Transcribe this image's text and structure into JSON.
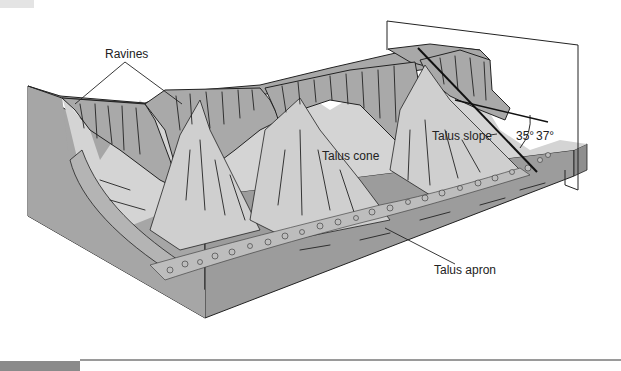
{
  "figure": {
    "type": "geologic block diagram",
    "labels": {
      "ravines": "Ravines",
      "talus_cone": "Talus cone",
      "talus_slope": "Talus slope",
      "talus_apron": "Talus apron",
      "angle_low": "35°",
      "angle_high": "37°"
    },
    "colors": {
      "plateau_top": "#a8a8a8",
      "cliff_face": "#a9a9a9",
      "talus_surface": "#d4d4d4",
      "block_side_front": "#9c9c9c",
      "block_side_left": "#a6a6a6",
      "ink": "#222222",
      "footer_bar": "#8a8a8a"
    }
  }
}
